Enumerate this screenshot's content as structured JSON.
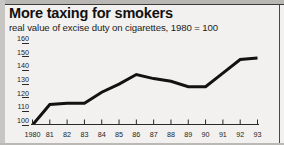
{
  "header": {
    "title": "More taxing for smokers",
    "subtitle": "real value of excise duty on cigarettes, 1980 = 100"
  },
  "colors": {
    "background": "#f2f1ef",
    "line": "#14120f",
    "axis": "#2a2927",
    "text": "#1c1b1a",
    "rule": "#4a4845"
  },
  "chart_data": {
    "type": "line",
    "title": "More taxing for smokers",
    "subtitle": "real value of excise duty on cigarettes, 1980 = 100",
    "xlabel": "",
    "ylabel": "",
    "x": [
      "1980",
      "81",
      "82",
      "83",
      "84",
      "85",
      "86",
      "87",
      "88",
      "89",
      "90",
      "91",
      "92",
      "93"
    ],
    "categories": [
      "1980",
      "81",
      "82",
      "83",
      "84",
      "85",
      "86",
      "87",
      "88",
      "89",
      "90",
      "91",
      "92",
      "93"
    ],
    "values": [
      100,
      115,
      116,
      116,
      124,
      130,
      137,
      134,
      132,
      128,
      128,
      138,
      148,
      149
    ],
    "series": [
      {
        "name": "real value of excise duty on cigarettes",
        "values": [
          100,
          115,
          116,
          116,
          124,
          130,
          137,
          134,
          132,
          128,
          128,
          138,
          148,
          149
        ]
      }
    ],
    "yticks": [
      100,
      110,
      120,
      130,
      140,
      150,
      160
    ],
    "ytick_labels": [
      "100",
      "110",
      "120",
      "130",
      "140",
      "150",
      "160"
    ],
    "xtick_labels": [
      "1980",
      "81",
      "82",
      "83",
      "84",
      "85",
      "86",
      "87",
      "88",
      "89",
      "90",
      "91",
      "92",
      "93"
    ],
    "ylim": [
      100,
      163
    ],
    "xlim": [
      "1980",
      "93"
    ],
    "grid": false,
    "legend": null,
    "legend_position": "none"
  }
}
